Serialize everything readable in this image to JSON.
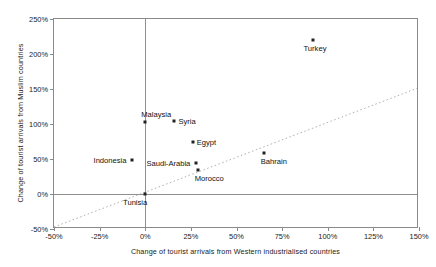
{
  "chart_data": {
    "type": "scatter",
    "title": "",
    "xlabel": "Change of tourist arrivals from Western industrialised countries",
    "ylabel": "Change of tourist arrivals from Muslim countries",
    "xlim": [
      -50,
      150
    ],
    "ylim": [
      -50,
      250
    ],
    "xticks": [
      "-50%",
      "-25%",
      "0%",
      "25%",
      "50%",
      "75%",
      "100%",
      "125%",
      "150%"
    ],
    "xtick_values": [
      -50,
      -25,
      0,
      25,
      50,
      75,
      100,
      125,
      150
    ],
    "yticks": [
      "-50%",
      "0%",
      "50%",
      "100%",
      "150%",
      "200%",
      "250%"
    ],
    "ytick_values": [
      -50,
      0,
      50,
      100,
      150,
      200,
      250
    ],
    "grid": false,
    "legend": "none",
    "zero_lines": true,
    "reference_line": {
      "name": "identity-line",
      "style": "dotted",
      "color": "#b0b0b0",
      "from": [
        -50,
        -50
      ],
      "to": [
        150,
        150
      ]
    },
    "points": [
      {
        "label": "Turkey",
        "x": 92,
        "y": 220,
        "label_pos": "below"
      },
      {
        "label": "Malaysia",
        "x": 0,
        "y": 103,
        "label_pos": "above-right"
      },
      {
        "label": "Syria",
        "x": 16,
        "y": 104,
        "label_pos": "right"
      },
      {
        "label": "Egypt",
        "x": 26,
        "y": 74,
        "label_pos": "right"
      },
      {
        "label": "Bahrain",
        "x": 65,
        "y": 58,
        "label_pos": "below-right"
      },
      {
        "label": "Saudi-Arabia",
        "x": 28,
        "y": 44,
        "label_pos": "left"
      },
      {
        "label": "Morocco",
        "x": 29,
        "y": 35,
        "label_pos": "below-right"
      },
      {
        "label": "Indonesia",
        "x": -7,
        "y": 48,
        "label_pos": "left"
      },
      {
        "label": "Tunisia",
        "x": 0,
        "y": 0,
        "label_pos": "below-left"
      }
    ]
  },
  "colors": {
    "point": "#222222",
    "axis": "#8a8a8a",
    "zero_line": "#8f8f8f",
    "reference_line": "#b0b0b0",
    "text": "#111111"
  }
}
